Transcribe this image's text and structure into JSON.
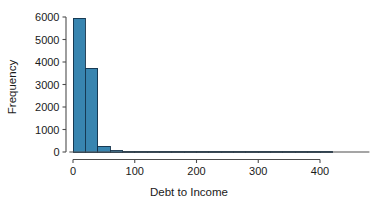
{
  "chart_data": {
    "type": "bar",
    "title": "",
    "xlabel": "Debt to Income",
    "ylabel": "Frequency",
    "xlim": [
      -5,
      480
    ],
    "ylim": [
      0,
      6200
    ],
    "grid": false,
    "legend": null,
    "bin_width": 20,
    "bin_starts": [
      0,
      20,
      40,
      60,
      80,
      100,
      120,
      140,
      160,
      180,
      200,
      220,
      240,
      260,
      280,
      300,
      320,
      340,
      360,
      380,
      400
    ],
    "categories": [
      "0-20",
      "20-40",
      "40-60",
      "60-80",
      "80-100",
      "100-120",
      "120-140",
      "140-160",
      "160-180",
      "180-200",
      "200-220",
      "220-240",
      "240-260",
      "260-280",
      "280-300",
      "300-320",
      "320-340",
      "340-360",
      "360-380",
      "380-400",
      "400-420"
    ],
    "values": [
      5950,
      3730,
      255,
      60,
      22,
      12,
      8,
      6,
      4,
      3,
      3,
      2,
      2,
      2,
      1,
      1,
      1,
      1,
      1,
      1,
      1
    ],
    "x_ticks": [
      0,
      100,
      200,
      300,
      400
    ],
    "x_tick_labels": [
      "0",
      "100",
      "200",
      "300",
      "400"
    ],
    "y_ticks": [
      0,
      1000,
      2000,
      3000,
      4000,
      5000,
      6000
    ],
    "y_tick_labels": [
      "0",
      "1000",
      "2000",
      "3000",
      "4000",
      "5000",
      "6000"
    ],
    "bar_fill_color": "#3885b0",
    "bar_edge_color": "#13324a",
    "axis_color": "#4d4d4d",
    "background_color": "#ffffff"
  },
  "axes": {
    "x_title": "Debt to Income",
    "y_title": "Frequency"
  }
}
